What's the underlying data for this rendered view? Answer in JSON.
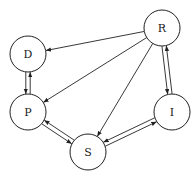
{
  "diagram": {
    "type": "directed-graph",
    "nodes": [
      {
        "id": "D",
        "label": "D",
        "cx": 28,
        "cy": 54,
        "r": 18
      },
      {
        "id": "P",
        "label": "P",
        "cx": 28,
        "cy": 112,
        "r": 18
      },
      {
        "id": "R",
        "label": "R",
        "cx": 162,
        "cy": 28,
        "r": 18
      },
      {
        "id": "I",
        "label": "I",
        "cx": 172,
        "cy": 112,
        "r": 18
      },
      {
        "id": "S",
        "label": "S",
        "cx": 88,
        "cy": 152,
        "r": 18
      }
    ],
    "edges": [
      {
        "from": "R",
        "to": "D"
      },
      {
        "from": "R",
        "to": "P"
      },
      {
        "from": "R",
        "to": "S"
      },
      {
        "from": "R",
        "to": "I"
      },
      {
        "from": "I",
        "to": "R"
      },
      {
        "from": "D",
        "to": "P"
      },
      {
        "from": "P",
        "to": "D"
      },
      {
        "from": "S",
        "to": "P"
      },
      {
        "from": "P",
        "to": "S"
      },
      {
        "from": "S",
        "to": "I"
      },
      {
        "from": "I",
        "to": "S"
      }
    ]
  }
}
